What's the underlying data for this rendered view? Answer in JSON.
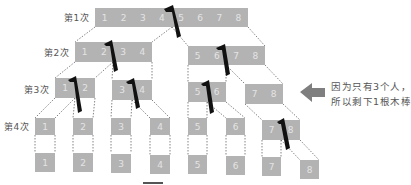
{
  "rows": [
    {
      "label": "第1次",
      "groups": [
        [
          "1",
          "2",
          "3",
          "4",
          "5",
          "6",
          "7",
          "8"
        ]
      ]
    },
    {
      "label": "第2次",
      "groups": [
        [
          "1",
          "2",
          "3",
          "4"
        ],
        [
          "5",
          "6",
          "7",
          "8"
        ]
      ]
    },
    {
      "label": "第3次",
      "groups": [
        [
          "1",
          "2"
        ],
        [
          "3",
          "4"
        ],
        [
          "5",
          "6"
        ],
        [
          "7",
          "8"
        ]
      ]
    },
    {
      "label": "第4次",
      "groups": [
        [
          "1"
        ],
        [
          "2"
        ],
        [
          "3"
        ],
        [
          "4"
        ],
        [
          "5"
        ],
        [
          "6"
        ],
        [
          "7",
          "8"
        ]
      ]
    },
    {
      "label": "",
      "groups": [
        [
          "1"
        ],
        [
          "2"
        ],
        [
          "3"
        ],
        [
          "4"
        ],
        [
          "5"
        ],
        [
          "6"
        ],
        [
          "7"
        ],
        [
          "8"
        ]
      ]
    }
  ],
  "note": {
    "line1": "因为只有3个人，",
    "line2": "所以剩下1根木棒"
  },
  "icons": {
    "cut": "saw-cut-icon",
    "pointer": "left-arrow-icon"
  },
  "colors": {
    "stick": "#b3b3b3",
    "stick_text": "#e4e4e4",
    "cut_mark": "#111111",
    "arrow": "#7f7f7f",
    "label": "#555555"
  }
}
